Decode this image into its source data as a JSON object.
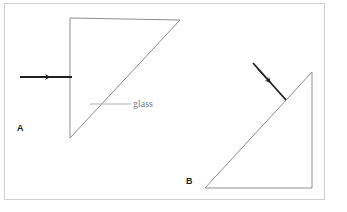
{
  "figure": {
    "background_color": "#ffffff",
    "frame": {
      "color": "#cfcfd1",
      "x": 4,
      "y": 3,
      "width": 321,
      "height": 197
    },
    "shape_stroke_color": "#8d8d8f",
    "arrow_color": "#231f20",
    "leader_color": "#a8a8aa",
    "panels": [
      {
        "id": "panel-a",
        "label": "A",
        "label_x": 17,
        "label_y": 123,
        "triangle_points": "70,18 180,20 70,138",
        "description": "right triangle with vertical left side, horizontal top side, hypotenuse from top-right to bottom-left",
        "arrow": {
          "name": "incident-ray-arrow-a",
          "x1": 20,
          "y1": 77,
          "x2": 72,
          "y2": 77,
          "head_x": 47,
          "head_y": 77,
          "direction": "right"
        }
      },
      {
        "id": "panel-b",
        "label": "B",
        "label_x": 186,
        "label_y": 176,
        "triangle_points": "205,188 312,188 312,72",
        "description": "right triangle with right angle at bottom-right, horizontal bottom side, vertical right side, hypotenuse from bottom-left to top-right",
        "arrow": {
          "name": "incident-ray-arrow-b",
          "x1": 253,
          "y1": 63,
          "x2": 286,
          "y2": 100,
          "head_x": 268,
          "head_y": 80,
          "direction": "down-right"
        }
      }
    ],
    "callouts": [
      {
        "name": "glass-callout",
        "text": "glass",
        "leader_x1": 90,
        "leader_y1": 104,
        "leader_x2": 131,
        "leader_y2": 104,
        "text_x": 133,
        "text_y": 98
      }
    ]
  }
}
